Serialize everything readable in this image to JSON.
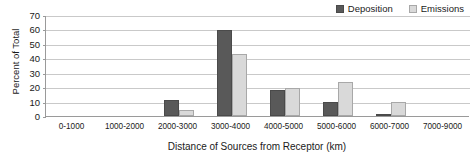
{
  "chart_data": {
    "type": "bar",
    "title": "",
    "xlabel": "Distance of Sources from Receptor (km)",
    "ylabel": "Percent of Total",
    "ylim": [
      0,
      70
    ],
    "ytick_step": 10,
    "yticks": [
      70,
      60,
      50,
      40,
      30,
      20,
      10,
      0
    ],
    "grid": true,
    "legend_position": "top-right",
    "categories": [
      "0-1000",
      "1000-2000",
      "2000-3000",
      "3000-4000",
      "4000-5000",
      "5000-6000",
      "6000-7000",
      "7000-9000"
    ],
    "series": [
      {
        "name": "Deposition",
        "color": "#595959",
        "values": [
          0,
          0,
          11,
          59.5,
          18,
          10,
          1.5,
          0
        ]
      },
      {
        "name": "Emissions",
        "color": "#d9d9d9",
        "values": [
          0,
          0,
          4.5,
          43,
          19.5,
          23.5,
          10,
          0
        ]
      }
    ]
  },
  "legend": {
    "items": [
      {
        "label": "Deposition"
      },
      {
        "label": "Emissions"
      }
    ]
  },
  "axes": {
    "y_title": "Percent of Total",
    "x_title": "Distance of Sources from Receptor (km)"
  },
  "clipped_title": ""
}
